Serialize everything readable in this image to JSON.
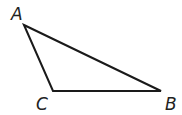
{
  "diagram": {
    "type": "triangle",
    "vertices": [
      {
        "name": "A",
        "x": 24,
        "y": 25,
        "label_x": 11,
        "label_y": 20
      },
      {
        "name": "B",
        "x": 161,
        "y": 91,
        "label_x": 165,
        "label_y": 110
      },
      {
        "name": "C",
        "x": 53,
        "y": 91,
        "label_x": 36,
        "label_y": 110
      }
    ],
    "edges": [
      [
        "A",
        "B"
      ],
      [
        "B",
        "C"
      ],
      [
        "C",
        "A"
      ]
    ],
    "stroke_color": "#1a1a1a"
  }
}
